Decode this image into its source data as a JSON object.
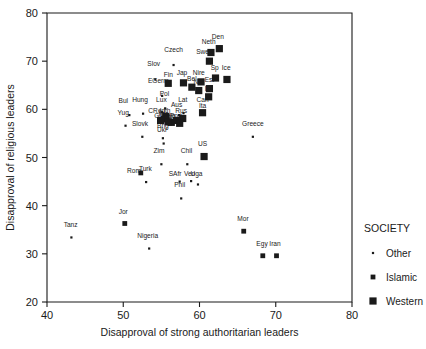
{
  "chart_data": {
    "type": "scatter",
    "title": "",
    "xlabel": "Disapproval of strong authoritarian leaders",
    "ylabel": "Disapproval of religious leaders",
    "xlim": [
      40,
      80
    ],
    "ylim": [
      20,
      80
    ],
    "xticks": [
      40,
      50,
      60,
      70,
      80
    ],
    "yticks": [
      20,
      30,
      40,
      50,
      60,
      70,
      80
    ],
    "grid": false,
    "legend": {
      "title": "SOCIETY",
      "position": "right",
      "entries": [
        {
          "name": "Other",
          "marker": "tiny-dot"
        },
        {
          "name": "Islamic",
          "marker": "small-square"
        },
        {
          "name": "Western",
          "marker": "large-square"
        }
      ]
    },
    "series": [
      {
        "name": "Other",
        "marker": "tiny-dot",
        "points": [
          {
            "label": "Czech",
            "x": 56.6,
            "y": 69.2,
            "lx": 56.6,
            "ly": 71.9
          },
          {
            "label": "Slov",
            "x": 54.2,
            "y": 66.2,
            "lx": 54.0,
            "ly": 68.9
          },
          {
            "label": "EGerm",
            "x": 55.1,
            "y": 62.8,
            "lx": 54.6,
            "ly": 65.4
          },
          {
            "label": "Pol",
            "x": 55.5,
            "y": 60.2,
            "lx": 55.4,
            "ly": 62.7
          },
          {
            "label": "Hung",
            "x": 52.6,
            "y": 59.1,
            "lx": 52.2,
            "ly": 61.5
          },
          {
            "label": "Bul",
            "x": 50.8,
            "y": 58.8,
            "lx": 50.0,
            "ly": 61.3
          },
          {
            "label": "Lux",
            "x": 55.1,
            "y": 59.4,
            "lx": 55.0,
            "ly": 61.5
          },
          {
            "label": "Lat",
            "x": 57.9,
            "y": 59.2,
            "lx": 57.8,
            "ly": 61.5
          },
          {
            "label": "Can",
            "x": 60.7,
            "y": 59.5,
            "lx": 60.4,
            "ly": 61.5
          },
          {
            "label": "Yug",
            "x": 50.3,
            "y": 56.6,
            "lx": 50.0,
            "ly": 58.8
          },
          {
            "label": "CRep",
            "x": 55.2,
            "y": 58.2,
            "lx": 54.4,
            "ly": 59.2
          },
          {
            "label": "Aus",
            "x": 57.3,
            "y": 58.8,
            "lx": 57.0,
            "ly": 60.4
          },
          {
            "label": "Slovk",
            "x": 52.5,
            "y": 54.3,
            "lx": 52.2,
            "ly": 56.5
          },
          {
            "label": "Brig",
            "x": 55.2,
            "y": 54.0,
            "lx": 55.2,
            "ly": 56.2
          },
          {
            "label": "Ukr",
            "x": 55.3,
            "y": 52.9,
            "lx": 55.1,
            "ly": 55.2
          },
          {
            "label": "Zim",
            "x": 55.0,
            "y": 48.6,
            "lx": 54.7,
            "ly": 50.9
          },
          {
            "label": "Chil",
            "x": 58.4,
            "y": 48.6,
            "lx": 58.3,
            "ly": 50.9
          },
          {
            "label": "Greece",
            "x": 67.0,
            "y": 54.3,
            "lx": 67.0,
            "ly": 56.5
          },
          {
            "label": "Turk",
            "x": 53.0,
            "y": 44.9,
            "lx": 52.9,
            "ly": 47.2
          },
          {
            "label": "SAfr",
            "x": 57.4,
            "y": 45.0,
            "lx": 56.8,
            "ly": 46.2
          },
          {
            "label": "Ven",
            "x": 58.9,
            "y": 45.1,
            "lx": 58.7,
            "ly": 46.2
          },
          {
            "label": "Uga",
            "x": 59.8,
            "y": 44.4,
            "lx": 59.6,
            "ly": 46.2
          },
          {
            "label": "Phil",
            "x": 57.6,
            "y": 41.5,
            "lx": 57.4,
            "ly": 43.8
          },
          {
            "label": "Tanz",
            "x": 43.2,
            "y": 33.4,
            "lx": 43.1,
            "ly": 35.6
          },
          {
            "label": "Nigeria",
            "x": 53.4,
            "y": 31.1,
            "lx": 53.2,
            "ly": 33.3
          }
        ]
      },
      {
        "name": "Islamic",
        "marker": "small-square",
        "points": [
          {
            "label": "Rom",
            "x": 52.3,
            "y": 46.8,
            "lx": 51.4,
            "ly": 46.7
          },
          {
            "label": "Jor",
            "x": 50.2,
            "y": 36.3,
            "lx": 50.0,
            "ly": 38.3
          },
          {
            "label": "Mor",
            "x": 65.8,
            "y": 34.7,
            "lx": 65.7,
            "ly": 36.8
          },
          {
            "label": "Egy",
            "x": 68.3,
            "y": 29.6,
            "lx": 68.2,
            "ly": 31.7
          },
          {
            "label": "Iran",
            "x": 70.1,
            "y": 29.6,
            "lx": 69.9,
            "ly": 31.7
          }
        ]
      },
      {
        "name": "Western",
        "marker": "large-square",
        "points": [
          {
            "label": "Den",
            "x": 62.6,
            "y": 72.6,
            "lx": 62.4,
            "ly": 74.6
          },
          {
            "label": "Neth",
            "x": 61.5,
            "y": 71.8,
            "lx": 61.2,
            "ly": 73.5
          },
          {
            "label": "Swe",
            "x": 61.3,
            "y": 70.0,
            "lx": 60.4,
            "ly": 71.4
          },
          {
            "label": "Ice",
            "x": 63.6,
            "y": 66.2,
            "lx": 63.5,
            "ly": 68.2
          },
          {
            "label": "Sp",
            "x": 62.1,
            "y": 66.5,
            "lx": 62.0,
            "ly": 68.2
          },
          {
            "label": "Nire",
            "x": 60.2,
            "y": 65.7,
            "lx": 59.9,
            "ly": 67.2
          },
          {
            "label": "Jap",
            "x": 57.9,
            "y": 65.5,
            "lx": 57.7,
            "ly": 67.2
          },
          {
            "label": "Est",
            "x": 61.3,
            "y": 64.3,
            "lx": 61.3,
            "ly": 65.6
          },
          {
            "label": "Fin",
            "x": 55.9,
            "y": 65.4,
            "lx": 55.9,
            "ly": 66.8
          },
          {
            "label": "Bel",
            "x": 59.0,
            "y": 64.6,
            "lx": 59.0,
            "ly": 65.9
          },
          {
            "label": "Nor",
            "x": 59.9,
            "y": 63.9,
            "lx": 59.9,
            "ly": 65.2
          },
          {
            "label": "Ire",
            "x": 61.2,
            "y": 62.6,
            "lx": 61.2,
            "ly": 63.8
          },
          {
            "label": "Lith",
            "x": 55.6,
            "y": 58.5,
            "lx": 55.5,
            "ly": 59.2
          },
          {
            "label": "Rus",
            "x": 57.8,
            "y": 58.1,
            "lx": 57.6,
            "ly": 59.2
          },
          {
            "label": "Bela",
            "x": 56.3,
            "y": 57.3,
            "lx": 56.0,
            "ly": 58.1
          },
          {
            "label": "Ita",
            "x": 60.4,
            "y": 59.3,
            "lx": 60.4,
            "ly": 60.2
          },
          {
            "label": "US",
            "x": 60.6,
            "y": 50.2,
            "lx": 60.4,
            "ly": 52.3
          },
          {
            "label": "Fra",
            "x": 55.4,
            "y": 58.0,
            "lx": 55.3,
            "ly": 58.6
          },
          {
            "label": "Gbr",
            "x": 54.9,
            "y": 57.7,
            "lx": 54.8,
            "ly": 58.2
          },
          {
            "label": "Swi",
            "x": 55.9,
            "y": 57.4,
            "lx": 55.8,
            "ly": 58.0
          },
          {
            "label": "Port",
            "x": 57.0,
            "y": 57.7,
            "lx": 56.9,
            "ly": 58.3
          },
          {
            "label": "Slov2",
            "x": 57.4,
            "y": 57.1,
            "lx": 57.3,
            "ly": 57.8
          }
        ]
      }
    ]
  }
}
